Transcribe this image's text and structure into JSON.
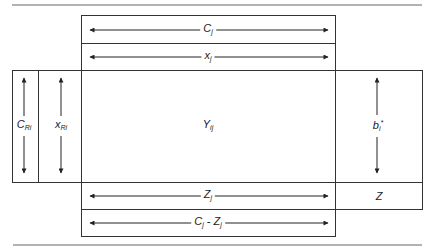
{
  "diagram": {
    "type": "table-layout-diagram",
    "stroke_color": "#333333",
    "rule_color": "#555555",
    "top_rows": [
      {
        "id": "c-row",
        "label": "C",
        "subscript": "j",
        "arrow": "horizontal-double"
      },
      {
        "id": "x-row",
        "label": "x",
        "subscript": "j",
        "arrow": "horizontal-double"
      }
    ],
    "left_columns": [
      {
        "id": "c-ri-col",
        "label": "C",
        "subscript": "Ri",
        "arrow": "vertical-double"
      },
      {
        "id": "x-ri-col",
        "label": "x",
        "subscript": "Ri",
        "arrow": "vertical-double"
      }
    ],
    "center_cell": {
      "label": "Y",
      "subscript": "ij"
    },
    "right_column": {
      "label": "b",
      "subscript": "i",
      "superscript": "*",
      "arrow": "vertical-double"
    },
    "bottom_rows": [
      {
        "id": "z-row",
        "label": "Z",
        "subscript": "j",
        "arrow": "horizontal-double"
      },
      {
        "id": "c-minus-z-row",
        "label": "C",
        "subscript": "j",
        "middle": " - Z",
        "subscript2": "j",
        "arrow": "horizontal-double"
      }
    ],
    "corner_cell": {
      "label": "Z"
    }
  }
}
